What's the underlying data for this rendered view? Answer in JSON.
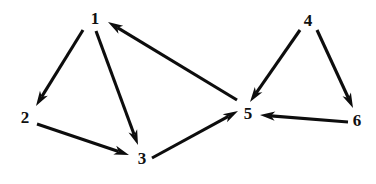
{
  "figure": {
    "kind": "directed-graph",
    "background_color": "#ffffff",
    "edge_color": "#0d0d0d",
    "label_color": "#101010",
    "width": 376,
    "height": 184
  },
  "chart_data": {
    "type": "diagram",
    "title": "",
    "graph_type": "directed graph",
    "node_count": 6,
    "edge_count": 8,
    "nodes": [
      {
        "id": "1",
        "label": "1",
        "x": 95,
        "y": 18
      },
      {
        "id": "2",
        "label": "2",
        "x": 25,
        "y": 117
      },
      {
        "id": "3",
        "label": "3",
        "x": 142,
        "y": 158
      },
      {
        "id": "4",
        "label": "4",
        "x": 308,
        "y": 20
      },
      {
        "id": "5",
        "label": "5",
        "x": 248,
        "y": 113
      },
      {
        "id": "6",
        "label": "6",
        "x": 357,
        "y": 120
      }
    ],
    "edges": [
      {
        "from": "1",
        "to": "2",
        "directed": true,
        "x1": 83,
        "y1": 30,
        "x2": 36,
        "y2": 106
      },
      {
        "from": "1",
        "to": "3",
        "directed": true,
        "x1": 96,
        "y1": 31,
        "x2": 138,
        "y2": 145
      },
      {
        "from": "2",
        "to": "3",
        "directed": true,
        "x1": 37,
        "y1": 124,
        "x2": 129,
        "y2": 155
      },
      {
        "from": "3",
        "to": "5",
        "directed": true,
        "x1": 152,
        "y1": 158,
        "x2": 238,
        "y2": 111
      },
      {
        "from": "5",
        "to": "1",
        "directed": true,
        "x1": 237,
        "y1": 100,
        "x2": 108,
        "y2": 22
      },
      {
        "from": "4",
        "to": "5",
        "directed": true,
        "x1": 300,
        "y1": 30,
        "x2": 250,
        "y2": 102
      },
      {
        "from": "4",
        "to": "6",
        "directed": true,
        "x1": 317,
        "y1": 30,
        "x2": 353,
        "y2": 108
      },
      {
        "from": "6",
        "to": "5",
        "directed": true,
        "x1": 348,
        "y1": 122,
        "x2": 260,
        "y2": 115
      }
    ]
  }
}
